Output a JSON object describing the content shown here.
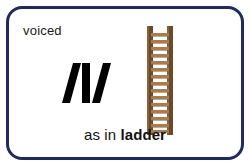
{
  "card": {
    "voicing_label": "voiced",
    "phoneme": "/l/",
    "phoneme_letter": "l",
    "caption_lead": "as in",
    "caption_word": "ladder",
    "illustration": "ladder-illustration",
    "colors": {
      "border": "#1d2a63",
      "card_background": "#ffffff",
      "text": "#1a1a1a",
      "ladder_rail": "#6b4a2b",
      "ladder_rung": "#a87c4f",
      "ladder_rail_highlight": "#8a6238"
    },
    "ladder": {
      "rung_count": 15
    }
  }
}
